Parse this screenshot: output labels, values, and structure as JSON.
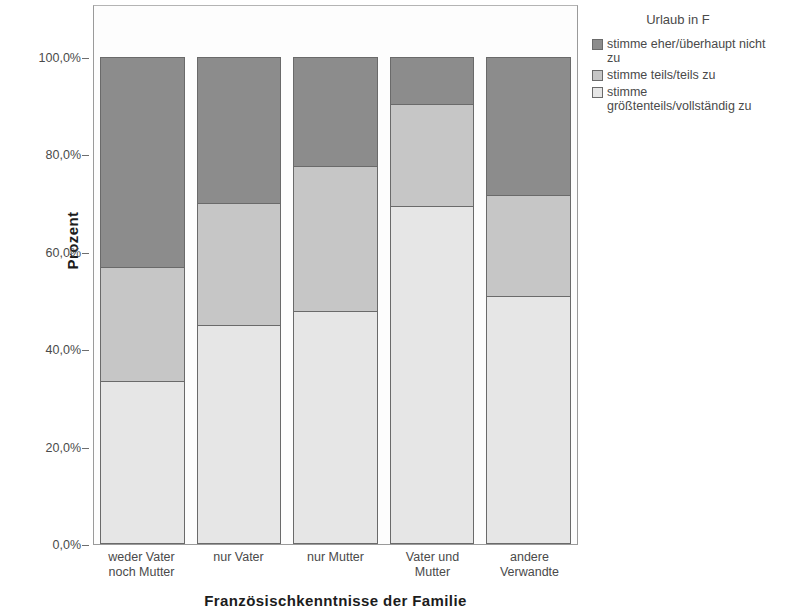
{
  "chart_data": {
    "type": "bar",
    "stacked": true,
    "normalized": "100%",
    "title": "",
    "xlabel": "Französischkenntnisse der Familie",
    "ylabel": "Prozent",
    "ylim": [
      0,
      100
    ],
    "ytick_labels": [
      "100,0%",
      "80,0%",
      "60,0%",
      "40,0%",
      "20,0%",
      "0,0%"
    ],
    "ytick_values": [
      100,
      80,
      60,
      40,
      20,
      0
    ],
    "grid": false,
    "legend_position": "right",
    "legend_title": "Urlaub in F",
    "categories": [
      "weder Vater noch Mutter",
      "nur Vater",
      "nur Mutter",
      "Vater und Mutter",
      "andere Verwandte"
    ],
    "category_lines": [
      [
        "weder Vater",
        "noch Mutter"
      ],
      [
        "nur Vater"
      ],
      [
        "nur Mutter"
      ],
      [
        "Vater und",
        "Mutter"
      ],
      [
        "andere",
        "Verwandte"
      ]
    ],
    "series": [
      {
        "name": "stimme eher/überhaupt nicht zu",
        "name_lines": [
          "stimme eher/überhaupt nicht",
          "zu"
        ],
        "color": "#8c8c8c",
        "values": [
          43.1,
          30.0,
          22.4,
          9.7,
          28.3
        ]
      },
      {
        "name": "stimme teils/teils zu",
        "name_lines": [
          "stimme teils/teils zu"
        ],
        "color": "#c6c6c6",
        "values": [
          23.4,
          25.0,
          29.8,
          20.9,
          20.8
        ]
      },
      {
        "name": "stimme größtenteils/vollständig zu",
        "name_lines": [
          "stimme",
          "größtenteils/vollständig zu"
        ],
        "color": "#e6e6e6",
        "values": [
          33.5,
          45.0,
          47.8,
          69.4,
          50.9
        ]
      }
    ]
  }
}
